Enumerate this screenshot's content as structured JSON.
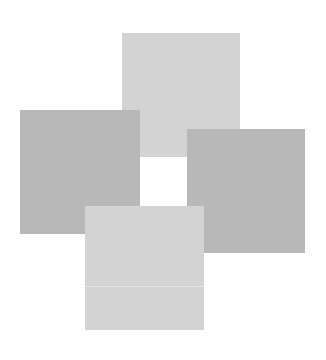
{
  "diagram": {
    "background": "#ffffff",
    "squares": [
      {
        "id": "top",
        "x": 122,
        "y": 33,
        "w": 118,
        "h": 124,
        "color": "#d3d3d3",
        "z": 1
      },
      {
        "id": "left",
        "x": 20,
        "y": 110,
        "w": 120,
        "h": 124,
        "color": "#b8b8b8",
        "z": 2
      },
      {
        "id": "right",
        "x": 187,
        "y": 129,
        "w": 118,
        "h": 124,
        "color": "#b8b8b8",
        "z": 1
      },
      {
        "id": "bottom",
        "x": 85,
        "y": 206,
        "w": 119,
        "h": 124,
        "color": "#d3d3d3",
        "z": 3
      }
    ],
    "center_square": {
      "x": 141,
      "y": 157,
      "w": 46,
      "h": 49,
      "color": "#ffffff"
    },
    "bottom_divider": {
      "offset_y": 80,
      "color": "#e6e6e6"
    }
  }
}
